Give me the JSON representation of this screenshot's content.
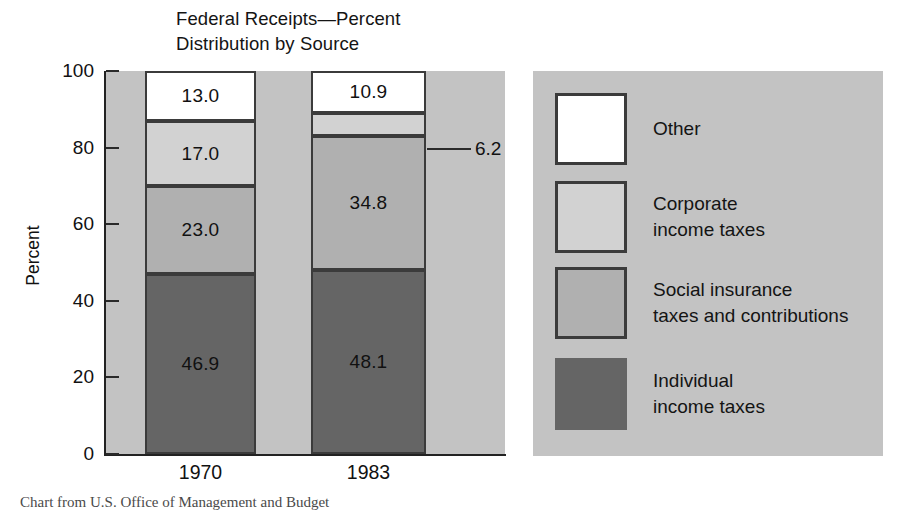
{
  "title": "Federal Receipts—Percent\nDistribution by Source",
  "axis": {
    "y_title": "Percent",
    "y_ticks": [
      "100",
      "80",
      "60",
      "40",
      "20",
      "0"
    ],
    "y_min": 0,
    "y_max": 100
  },
  "callout": {
    "value": "6.2"
  },
  "legend": [
    {
      "label": "Other",
      "color": "#ffffff"
    },
    {
      "label": "Corporate\nincome taxes",
      "color": "#d2d2d2"
    },
    {
      "label": "Social insurance\ntaxes and contributions",
      "color": "#b0b0b0"
    },
    {
      "label": "Individual\nincome taxes",
      "color": "#656565"
    }
  ],
  "source_caption": "Chart from U.S. Office of Management and Budget",
  "chart_data": {
    "type": "bar",
    "title": "Federal Receipts—Percent Distribution by Source",
    "xlabel": "",
    "ylabel": "Percent",
    "ylim": [
      0,
      100
    ],
    "grid": false,
    "legend_position": "right",
    "stacked": true,
    "categories": [
      "1970",
      "1983"
    ],
    "series": [
      {
        "name": "Individual income taxes",
        "color": "#656565",
        "values": [
          46.9,
          48.1
        ]
      },
      {
        "name": "Social insurance taxes and contributions",
        "color": "#b0b0b0",
        "values": [
          23.0,
          34.8
        ]
      },
      {
        "name": "Corporate income taxes",
        "color": "#d2d2d2",
        "values": [
          17.0,
          6.2
        ]
      },
      {
        "name": "Other",
        "color": "#ffffff",
        "values": [
          13.0,
          10.9
        ]
      }
    ],
    "annotations": [
      {
        "text": "6.2",
        "for": "Corporate income taxes 1983",
        "type": "leader-line"
      }
    ]
  }
}
